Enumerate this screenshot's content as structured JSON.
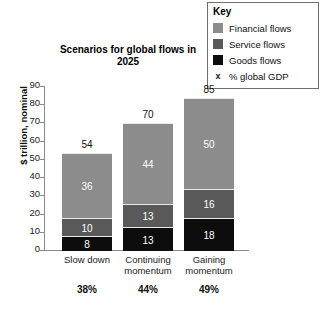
{
  "legend": {
    "title": "Key",
    "items": [
      {
        "label": "Financial flows",
        "marker": "swatch",
        "color": "#8c8c8c"
      },
      {
        "label": "Service flows",
        "marker": "swatch",
        "color": "#595959"
      },
      {
        "label": "Goods flows",
        "marker": "swatch",
        "color": "#0d0d0d"
      },
      {
        "label": "% global GDP",
        "marker": "x",
        "glyph": "x",
        "color": "#111111"
      }
    ]
  },
  "footnote": "",
  "chart_data": {
    "type": "bar",
    "stacked": true,
    "title": "Scenarios for global flows in 2025",
    "xlabel": "",
    "ylabel": "$ trillion, nominal",
    "ylim": [
      0,
      90
    ],
    "yticks": [
      0,
      10,
      20,
      30,
      40,
      50,
      60,
      70,
      80,
      90
    ],
    "grid": false,
    "legend_position": "top-right",
    "categories": [
      "Slow down",
      "Continuing momentum",
      "Gaining momentum"
    ],
    "series": [
      {
        "name": "Goods flows",
        "color": "#0d0d0d",
        "values": [
          8,
          13,
          18
        ]
      },
      {
        "name": "Service flows",
        "color": "#595959",
        "values": [
          10,
          13,
          16
        ]
      },
      {
        "name": "Financial flows",
        "color": "#8c8c8c",
        "values": [
          36,
          44,
          50
        ]
      }
    ],
    "totals": [
      54,
      70,
      85
    ],
    "annotations": {
      "name": "% global GDP",
      "values": [
        "38%",
        "44%",
        "49%"
      ]
    }
  }
}
